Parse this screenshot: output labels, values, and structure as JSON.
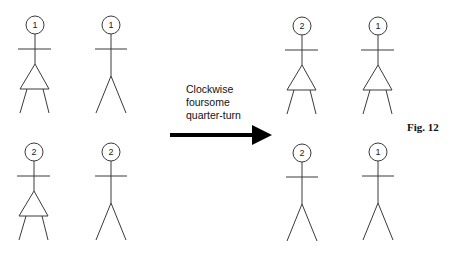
{
  "diagram": {
    "caption_lines": [
      "Clockwise",
      "foursome",
      "quarter-turn"
    ],
    "figure_label": "Fig. 12",
    "before": {
      "top_left": {
        "label": "1",
        "type": "female"
      },
      "top_right": {
        "label": "1",
        "type": "male"
      },
      "bottom_left": {
        "label": "2",
        "type": "female"
      },
      "bottom_right": {
        "label": "2",
        "type": "male"
      }
    },
    "after": {
      "top_left": {
        "label": "2",
        "type": "female"
      },
      "top_right": {
        "label": "1",
        "type": "female"
      },
      "bottom_left": {
        "label": "2",
        "type": "male"
      },
      "bottom_right": {
        "label": "1",
        "type": "male"
      }
    },
    "arrow": {
      "direction": "right",
      "color": "#000000"
    }
  }
}
